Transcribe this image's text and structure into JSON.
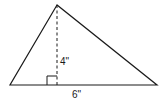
{
  "diagram": {
    "type": "triangle-with-altitude",
    "stroke_color": "#1a1a1a",
    "vertices": {
      "apex": [
        57,
        5
      ],
      "bottom_left": [
        10,
        85
      ],
      "bottom_right": [
        157,
        85
      ]
    },
    "altitude": {
      "label": "4\"",
      "style": "dashed",
      "foot": [
        57,
        85
      ]
    },
    "base": {
      "label": "6\""
    },
    "right_angle_marker": true
  }
}
